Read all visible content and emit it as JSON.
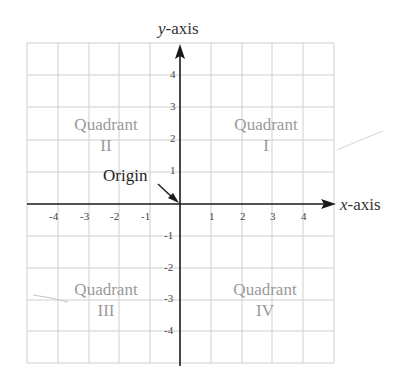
{
  "diagram": {
    "type": "cartesian-coordinate-plane",
    "axes": {
      "x_label_var": "x",
      "x_label_rest": "-axis",
      "y_label_var": "y",
      "y_label_rest": "-axis"
    },
    "x_ticks": [
      "-4",
      "-3",
      "-2",
      "-1",
      "1",
      "2",
      "3",
      "4"
    ],
    "y_ticks": [
      "4",
      "3",
      "2",
      "1",
      "-1",
      "-2",
      "-3",
      "-4"
    ],
    "origin_label": "Origin",
    "quadrants": [
      {
        "id": "I",
        "word": "Quadrant",
        "numeral": "I"
      },
      {
        "id": "II",
        "word": "Quadrant",
        "numeral": "II"
      },
      {
        "id": "III",
        "word": "Quadrant",
        "numeral": "III"
      },
      {
        "id": "IV",
        "word": "Quadrant",
        "numeral": "IV"
      }
    ],
    "grid": {
      "x_range": [
        -5,
        5
      ],
      "y_range": [
        -5,
        5
      ],
      "step": 1
    },
    "colors": {
      "grid": "#c8c8c8",
      "axis": "#1a1a1a",
      "quadrant_text": "#9a9a9a"
    }
  }
}
